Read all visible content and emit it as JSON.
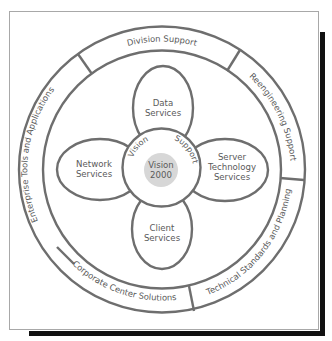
{
  "diagram": {
    "outer_ring": {
      "segments": [
        {
          "id": "division-support",
          "label": "Division Support"
        },
        {
          "id": "reengineering-support",
          "label": "Reengineering Support"
        },
        {
          "id": "technical-standards",
          "label": "Technical Standards and Planning"
        },
        {
          "id": "corporate-center",
          "label": "Corporate Center Solutions"
        },
        {
          "id": "enterprise-tools",
          "label": "Enterprise Tools and Applications"
        }
      ]
    },
    "petals": {
      "top": {
        "line1": "Data",
        "line2": "Services"
      },
      "left": {
        "line1": "Network",
        "line2": "Services"
      },
      "right": {
        "line1": "Server",
        "line2": "Technology",
        "line3": "Services"
      },
      "bottom": {
        "line1": "Client",
        "line2": "Services"
      }
    },
    "core": {
      "arc_left": "Vision",
      "arc_right": "Support",
      "center_line1": "Vision",
      "center_line2": "2000"
    },
    "colors": {
      "stroke": "#6e6e6e",
      "core_fill": "#d7d7d7",
      "shadow": "#111111",
      "text": "#5a5a5a"
    }
  }
}
